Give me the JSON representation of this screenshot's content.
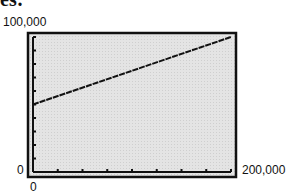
{
  "header": {
    "cut_text": "es:"
  },
  "chart_data": {
    "type": "line",
    "title": "",
    "xlabel": "",
    "ylabel": "",
    "xlim": [
      0,
      200000
    ],
    "ylim": [
      0,
      100000
    ],
    "x_tick_labels": [
      "0",
      "200,000"
    ],
    "y_tick_labels": [
      "0",
      "100,000"
    ],
    "x_ticks_count": 8,
    "y_ticks_count": 10,
    "grid": false,
    "background": "#e6e6e6",
    "series": [
      {
        "name": "line",
        "x": [
          0,
          200000
        ],
        "y": [
          50000,
          100000
        ],
        "color": "#111111"
      }
    ]
  },
  "labels": {
    "ymax": "100,000",
    "ymin": "0",
    "xmax": "200,000",
    "xmin": "0"
  }
}
